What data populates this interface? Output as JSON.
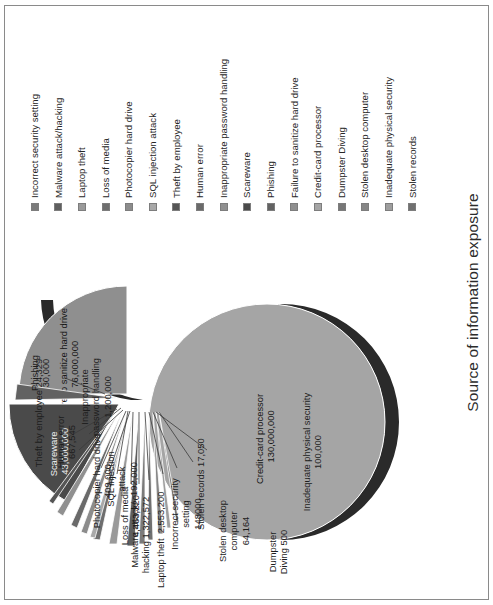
{
  "chart_data": {
    "type": "pie",
    "title": "Source of information exposure",
    "xlabel": "",
    "ylabel": "",
    "legend_position": "right",
    "grid": false,
    "categories": [
      "Incorrect security setting",
      "Malware attack/hacking",
      "Laptop theft",
      "Loss of media",
      "Photocopier hard drive",
      "SQL injection attack",
      "Theft by employee",
      "Human error",
      "Inappropriate password handling",
      "Scareware",
      "Phishing",
      "Failure to sanitize hard drive",
      "Credit-card processor",
      "Dumpster Diving",
      "Stolen desktop computer",
      "Inadequate physical security",
      "Stolen records"
    ],
    "values": [
      148000,
      1322572,
      2553200,
      4463220,
      409000,
      192000,
      24329,
      667545,
      1200000,
      43000000,
      30000,
      76000000,
      130000000,
      500,
      64164,
      100000,
      17050
    ],
    "value_labels": [
      "148000",
      "1,322,572",
      "2,553,200",
      "4,463,220",
      "409,000",
      "192,000",
      "24,329",
      "667,545",
      "1,200,000",
      "43,000,000",
      "30,000",
      "76,000,000",
      "130,000,000",
      "500",
      "64,164",
      "100,000",
      "17,050"
    ]
  },
  "title": "Source of information exposure",
  "legend": {
    "items": [
      {
        "label": "Incorrect security setting",
        "color": "#7b7b7b"
      },
      {
        "label": "Malware attack/hacking",
        "color": "#5f5f5f"
      },
      {
        "label": "Laptop theft",
        "color": "#9a9a9a"
      },
      {
        "label": "Loss of media",
        "color": "#6e6e6e"
      },
      {
        "label": "Photocopier hard drive",
        "color": "#8c8c8c"
      },
      {
        "label": "SQL injection attack",
        "color": "#a8a8a8"
      },
      {
        "label": "Theft by employee",
        "color": "#555555"
      },
      {
        "label": "Human error",
        "color": "#6a6a6a"
      },
      {
        "label": "Inappropriate password handling",
        "color": "#909090"
      },
      {
        "label": "Scareware",
        "color": "#4a4a4a"
      },
      {
        "label": "Phishing",
        "color": "#626262"
      },
      {
        "label": "Failure to sanitize hard drive",
        "color": "#8f8f8f"
      },
      {
        "label": "Credit-card processor",
        "color": "#a5a5a5"
      },
      {
        "label": "Dumpster Diving",
        "color": "#777777"
      },
      {
        "label": "Stolen desktop computer",
        "color": "#868686"
      },
      {
        "label": "Inadequate physical security",
        "color": "#9e9e9e"
      },
      {
        "label": "Stolen records",
        "color": "#707070"
      }
    ]
  },
  "slice_labels": {
    "scareware": "Scareware\n43,000,000",
    "sanitize": "Failure to sanitize hard drive\n76,000,000",
    "creditcard": "Credit-card processor\n130,000,000"
  },
  "callouts": {
    "theft_employee": "Theft by employee 24,329",
    "human_error": "Human error\n667,545",
    "inappropriate": "Inappropriate\npassword handling\n1,200,000",
    "phishing": "Phishing\n30,000",
    "photocopier": "Photocopier hard drive\n409,000",
    "sql": "SQL injection\nattack\n192,000",
    "loss_media": "Loss of media\n4,463,220",
    "malware": "Malware attack/\nhacking 1,322,572",
    "laptop": "Laptop theft  2,553,200",
    "incorrect": "Incorrect security\nsetting\n148000",
    "stolen_records": "Stolen records 17,050",
    "stolen_desktop": "Stolen desktop\ncomputer\n64,164",
    "dumpster": "Dumpster\nDiving 500",
    "inadequate": "Inadequate physical security\n100,000"
  }
}
